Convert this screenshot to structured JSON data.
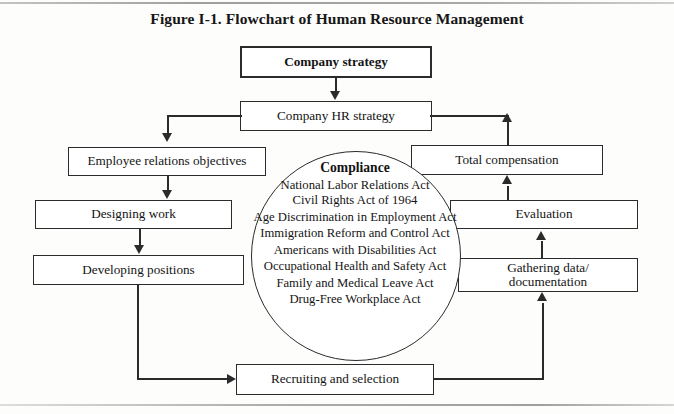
{
  "figure": {
    "title": "Figure I-1. Flowchart of Human Resource Management"
  },
  "nodes": {
    "company_strategy": "Company strategy",
    "company_hr_strategy": "Company HR strategy",
    "employee_relations_objectives": "Employee relations objectives",
    "designing_work": "Designing work",
    "developing_positions": "Developing positions",
    "recruiting_and_selection": "Recruiting and selection",
    "gathering_data": "Gathering data/ documentation",
    "gathering_data_line1": "Gathering data/",
    "gathering_data_line2": "documentation",
    "evaluation": "Evaluation",
    "total_compensation": "Total compensation"
  },
  "compliance": {
    "heading": "Compliance",
    "acts": [
      "National Labor Relations Act",
      "Civil Rights Act of 1964",
      "Age Discrimination in Employment Act",
      "Immigration Reform and Control Act",
      "Americans with Disabilities Act",
      "Occupational Health and Safety Act",
      "Family and Medical Leave Act",
      "Drug-Free Workplace Act"
    ]
  },
  "colors": {
    "ink": "#2b2b2b",
    "paper": "#fdfdfb",
    "box_fill": "#ffffff"
  }
}
